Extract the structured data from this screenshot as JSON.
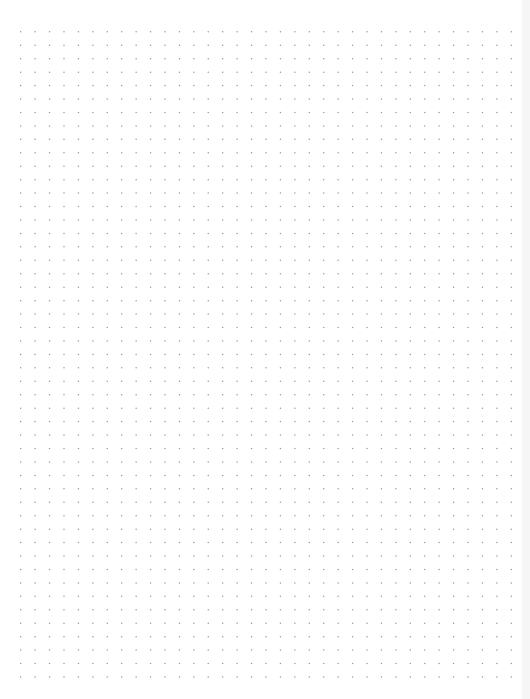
{
  "document": {
    "type": "dot grid paper",
    "background_color": "#ffffff",
    "dot_color": "#9a9a9a",
    "edge_color": "#f6f6f6",
    "grid": {
      "columns": 35,
      "rows": 49
    },
    "footer_text": ""
  }
}
